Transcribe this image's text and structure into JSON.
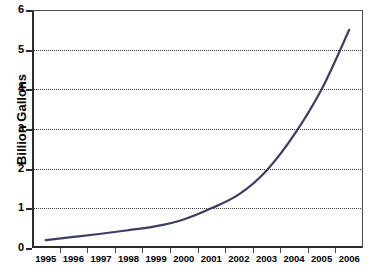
{
  "chart_data": {
    "type": "line",
    "title": "",
    "subtitle": "",
    "xlabel": "",
    "ylabel": "Billion Gallons",
    "x": [
      1995,
      1996,
      1997,
      1998,
      1999,
      2000,
      2001,
      2002,
      2003,
      2004,
      2005,
      2006
    ],
    "categories": [
      "1995",
      "1996",
      "1997",
      "1998",
      "1999",
      "2000",
      "2001",
      "2002",
      "2003",
      "2004",
      "2005",
      "2006"
    ],
    "series": [
      {
        "name": "Billion Gallons",
        "values": [
          0.2,
          0.28,
          0.36,
          0.45,
          0.55,
          0.72,
          1.0,
          1.35,
          1.95,
          2.85,
          4.0,
          5.5
        ],
        "color": "#3b3f63"
      }
    ],
    "values": [
      0.2,
      0.28,
      0.36,
      0.45,
      0.55,
      0.72,
      1.0,
      1.35,
      1.95,
      2.85,
      4.0,
      5.5
    ],
    "ylim": [
      0,
      6
    ],
    "xlim": [
      1995,
      2006
    ],
    "ytick_labels": [
      "6",
      "5",
      "4",
      "3",
      "2",
      "1",
      "0"
    ],
    "ytick_values": [
      6,
      5,
      4,
      3,
      2,
      1,
      0
    ],
    "xtick_labels": [
      "1995",
      "1996",
      "1997",
      "1998",
      "1999",
      "2000",
      "2001",
      "2002",
      "2003",
      "2004",
      "2005",
      "2006"
    ],
    "grid": "horizontal-dotted",
    "grid_color": "#3a3a3a",
    "legend": "none",
    "legend_position": "none",
    "axis_color": "#2b2b2b",
    "background": "#ffffff",
    "annotations": []
  },
  "axes": {
    "y_title": "Billion Gallons",
    "y_labels": [
      "6",
      "5",
      "4",
      "3",
      "2",
      "1",
      "0"
    ],
    "x_labels": [
      "1995",
      "1996",
      "1997",
      "1998",
      "1999",
      "2000",
      "2001",
      "2002",
      "2003",
      "2004",
      "2005",
      "2006"
    ]
  }
}
